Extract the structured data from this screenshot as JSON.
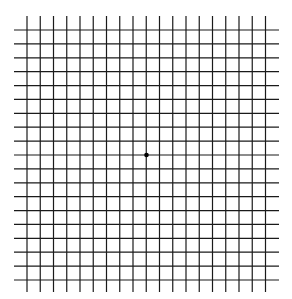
{
  "grid": {
    "type": "amsler-grid",
    "rows": 19,
    "cols": 19,
    "line_color": "#1a1a1a",
    "background_color": "#ffffff",
    "vertical_lines": {
      "first_x": 27,
      "last_x": 265.5,
      "y_start": 16,
      "y_end": 292
    },
    "horizontal_lines": {
      "first_y": 30,
      "last_y": 280,
      "x_start": 14,
      "x_end": 279
    },
    "center_dot": {
      "x": 146.5,
      "y": 155,
      "radius": 2.3,
      "color": "#000000"
    }
  }
}
